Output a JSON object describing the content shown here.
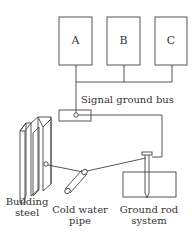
{
  "diagram": {
    "title": "",
    "boxes": [
      {
        "id": "A",
        "label": "A"
      },
      {
        "id": "B",
        "label": "B"
      },
      {
        "id": "C",
        "label": "C"
      }
    ],
    "labels": {
      "signal_ground_bus": "Signal ground bus",
      "building_steel_1": "Building",
      "building_steel_2": "steel",
      "cold_water_1": "Cold water",
      "cold_water_2": "pipe",
      "ground_rod_1": "Ground rod",
      "ground_rod_2": "system"
    },
    "colors": {
      "line": "#444444",
      "text": "#333333",
      "background": "#ffffff"
    }
  }
}
